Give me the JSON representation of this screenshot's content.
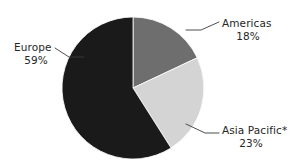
{
  "chart_data": {
    "type": "pie",
    "title": "",
    "xlabel": "",
    "ylabel": "",
    "categories": [
      "Americas",
      "Asia Pacific*",
      "Europe"
    ],
    "values": [
      18,
      23,
      59
    ],
    "value_unit": "%",
    "labels": [
      {
        "name": "Americas",
        "percent": "18%",
        "value": 18,
        "color": "#6e6e6e"
      },
      {
        "name": "Asia Pacific*",
        "percent": "23%",
        "value": 23,
        "color": "#d4d4d4"
      },
      {
        "name": "Europe",
        "percent": "59%",
        "value": 59,
        "color": "#1a1a1a"
      }
    ],
    "legend_position": "callout-labels",
    "grid": false,
    "start_angle_deg": 0,
    "direction": "clockwise",
    "footnote_marker": "*"
  },
  "colors": {
    "background": "#ffffff",
    "americas": "#6e6e6e",
    "asia_pacific": "#d4d4d4",
    "europe": "#1a1a1a",
    "leader_line": "#3a3a3a",
    "text": "#262626"
  },
  "geometry": {
    "center_x": 133,
    "center_y": 88,
    "radius": 71
  }
}
